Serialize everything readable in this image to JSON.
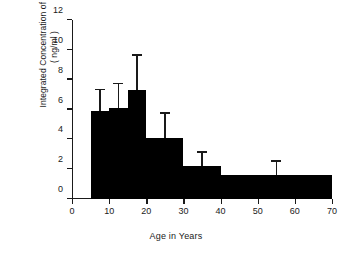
{
  "chart_data": {
    "type": "bar",
    "title": "",
    "xlabel": "Age in Years",
    "ylabel": "Integrated Concentration of GH\n( ng/ml )",
    "ylabel_line1": "Integrated Concentration of GH",
    "ylabel_line2": "( ng/ml )",
    "xlim": [
      0,
      70
    ],
    "ylim": [
      0,
      12
    ],
    "xticks": [
      0,
      10,
      20,
      30,
      40,
      50,
      60,
      70
    ],
    "yticks": [
      0,
      2,
      4,
      6,
      8,
      10,
      12
    ],
    "xtick_labels": [
      "0",
      "10",
      "20",
      "30",
      "40",
      "50",
      "60",
      "70"
    ],
    "ytick_labels": [
      "0",
      "2",
      "4",
      "6",
      "8",
      "10",
      "12"
    ],
    "grid": false,
    "legend": null,
    "bar_color": "#000000",
    "axis_color": "#1a1a1a",
    "bins": [
      {
        "x_start": 5,
        "x_end": 10,
        "value": 5.9,
        "error_top": 7.3,
        "error_x": 7.5
      },
      {
        "x_start": 10,
        "x_end": 15,
        "value": 6.1,
        "error_top": 7.7,
        "error_x": 12.5
      },
      {
        "x_start": 15,
        "x_end": 20,
        "value": 7.3,
        "error_top": 9.6,
        "error_x": 17.5
      },
      {
        "x_start": 20,
        "x_end": 30,
        "value": 4.1,
        "error_top": 5.7,
        "error_x": 25.0
      },
      {
        "x_start": 30,
        "x_end": 40,
        "value": 2.2,
        "error_top": 3.1,
        "error_x": 35.0
      },
      {
        "x_start": 40,
        "x_end": 70,
        "value": 1.6,
        "error_top": 2.5,
        "error_x": 55.0
      }
    ],
    "categories": [
      "5-10",
      "10-15",
      "15-20",
      "20-30",
      "30-40",
      "40-70"
    ],
    "values": [
      5.9,
      6.1,
      7.3,
      4.1,
      2.2,
      1.6
    ],
    "errors_top": [
      7.3,
      7.7,
      9.6,
      5.7,
      3.1,
      2.5
    ]
  }
}
